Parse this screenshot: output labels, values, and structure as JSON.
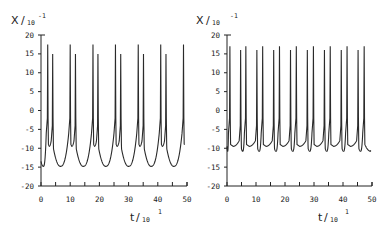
{
  "chart_data": [
    {
      "type": "line",
      "panel": "left",
      "ylabel": "X",
      "ylabel_scale": "10",
      "ylabel_exp": "-1",
      "xlabel": "t",
      "xlabel_scale": "10",
      "xlabel_exp": "1",
      "xlim": [
        0,
        50
      ],
      "ylim": [
        -20,
        20
      ],
      "xticks": [
        0,
        10,
        20,
        30,
        40,
        50
      ],
      "xminor": [
        5,
        15,
        25,
        35,
        45
      ],
      "yticks": [
        -20,
        -15,
        -10,
        -5,
        0,
        5,
        10,
        15,
        20
      ],
      "grid": false,
      "series": [
        {
          "name": "x(t) bursting, doublet spikes",
          "start_value": -13.5,
          "trough_min": -14.8,
          "period": 7.75,
          "spike_pairs": [
            [
              2.3,
              4.0
            ],
            [
              10.0,
              11.8
            ],
            [
              17.8,
              19.5
            ],
            [
              25.5,
              27.3
            ],
            [
              33.3,
              35.1
            ],
            [
              41.0,
              42.8
            ],
            [
              48.8,
              null
            ]
          ],
          "spike_peaks": [
            17.5,
            15.0
          ],
          "inter_spike_dip": -9.5,
          "end_value": -9.0,
          "t_end": 49.0
        }
      ]
    },
    {
      "type": "line",
      "panel": "right",
      "ylabel": "X",
      "ylabel_scale": "10",
      "ylabel_exp": "-1",
      "xlabel": "t",
      "xlabel_scale": "10",
      "xlabel_exp": "1",
      "xlim": [
        0,
        50
      ],
      "ylim": [
        -20,
        20
      ],
      "xticks": [
        0,
        10,
        20,
        30,
        40,
        50
      ],
      "xminor": [
        5,
        15,
        25,
        35,
        45
      ],
      "yticks": [
        -20,
        -15,
        -10,
        -5,
        0,
        5,
        10,
        15,
        20
      ],
      "grid": false,
      "series": [
        {
          "name": "x(t) periodic doublets",
          "start_value": -9.5,
          "trough_min": -10.8,
          "period": 5.85,
          "spike_pairs": [
            [
              1.0,
              4.7
            ],
            [
              6.5,
              10.3
            ],
            [
              12.3,
              16.1
            ],
            [
              18.1,
              21.9
            ],
            [
              23.9,
              27.7
            ],
            [
              29.8,
              33.6
            ],
            [
              35.6,
              39.4
            ],
            [
              41.4,
              45.2
            ],
            [
              47.3,
              null
            ]
          ],
          "spike_peaks_alternating": [
            16.0,
            17.0
          ],
          "inter_spike_dip": -9.5,
          "end_value": -10.5,
          "t_end": 49.5
        }
      ]
    }
  ]
}
